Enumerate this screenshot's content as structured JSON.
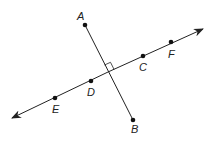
{
  "diagram": {
    "type": "perpendicular lines",
    "line": {
      "name": "line EF",
      "through": [
        "E",
        "D",
        "C",
        "F"
      ],
      "arrows": "both ends"
    },
    "segment": {
      "name": "segment AB",
      "endpoints": [
        "A",
        "B"
      ]
    },
    "right_angle_marker": true,
    "points": [
      {
        "label": "A",
        "x": 85,
        "y": 25,
        "lx": 77,
        "ly": 20
      },
      {
        "label": "B",
        "x": 133,
        "y": 120,
        "lx": 131,
        "ly": 133
      },
      {
        "label": "C",
        "x": 143,
        "y": 56,
        "lx": 139,
        "ly": 71
      },
      {
        "label": "D",
        "x": 91,
        "y": 81,
        "lx": 87,
        "ly": 96
      },
      {
        "label": "E",
        "x": 55,
        "y": 98,
        "lx": 52,
        "ly": 113
      },
      {
        "label": "F",
        "x": 171,
        "y": 42,
        "lx": 168,
        "ly": 58
      }
    ],
    "colors": {
      "stroke": "#222222",
      "background": "#ffffff"
    }
  }
}
